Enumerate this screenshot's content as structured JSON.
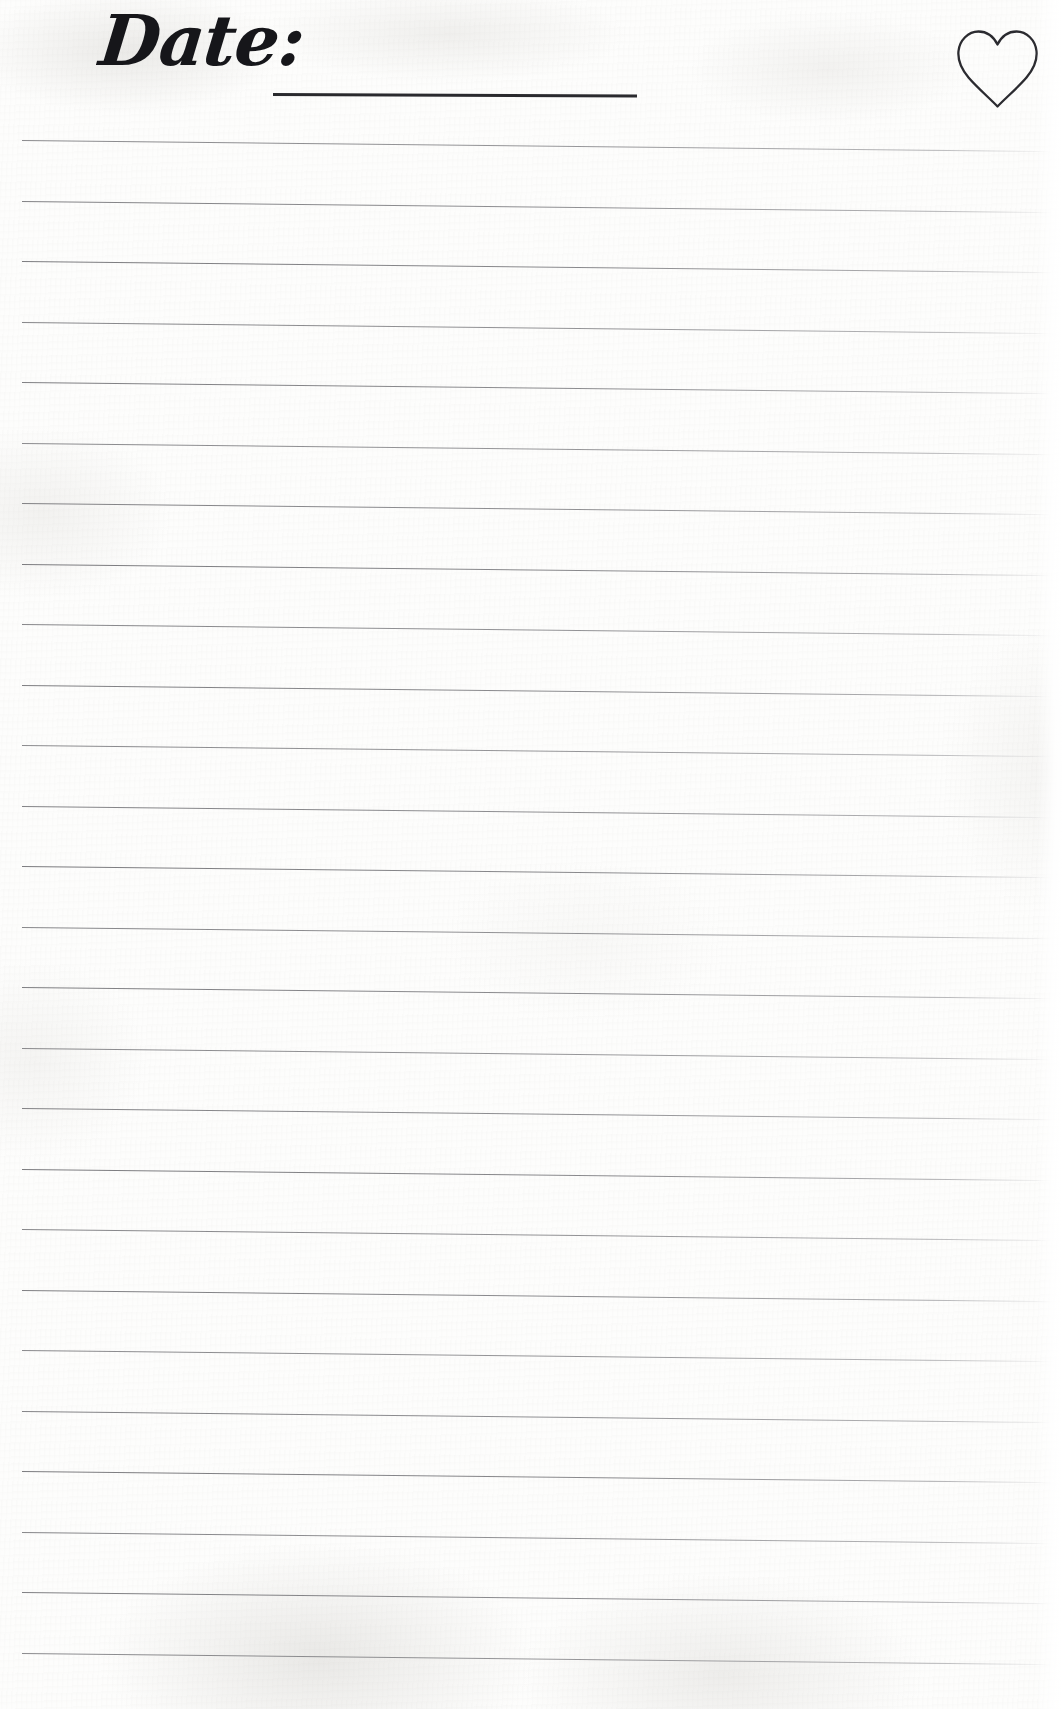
{
  "page": {
    "width": 1062,
    "height": 1709,
    "background_color": "#fdfdfc",
    "kind": "lined-journal-page"
  },
  "header": {
    "date_label": "Date:",
    "date_value": "",
    "date_underline": {
      "start_x": 273,
      "end_x": 637,
      "y": 93,
      "color": "#2a2a2e",
      "thickness": 3
    },
    "heart": {
      "icon": "heart-outline-icon",
      "stroke_color": "#2b2b30",
      "fill": "none",
      "x": 958,
      "y": 26,
      "width": 77,
      "height": 79
    }
  },
  "ruled_lines": {
    "count": 25,
    "color": "#6c6c70",
    "thickness": 1,
    "spacing": 60.5,
    "first_line_y": 140,
    "last_line_y": 1653,
    "left_x": 22,
    "right_x": 1055,
    "slope_degrees": 0.62,
    "y_positions": [
      140,
      200.5,
      261,
      321.5,
      382,
      442.5,
      503,
      563.5,
      624,
      684.5,
      745,
      805.5,
      866,
      926.5,
      987,
      1047.5,
      1108,
      1168.5,
      1229,
      1289.5,
      1350,
      1410.5,
      1471,
      1531.5,
      1592,
      1652.5
    ]
  }
}
